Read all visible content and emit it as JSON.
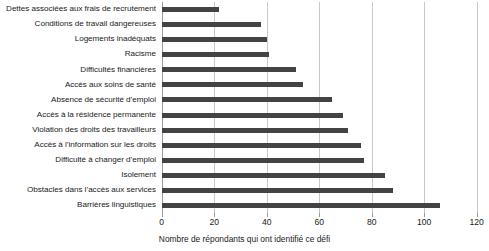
{
  "chart_data": {
    "type": "bar",
    "orientation": "horizontal",
    "title": "",
    "xlabel": "Nombre de répondants qui ont identifié ce défi",
    "ylabel": "",
    "xlim": [
      0,
      120
    ],
    "xticks": [
      0,
      20,
      40,
      60,
      80,
      100,
      120
    ],
    "grid": true,
    "legend": false,
    "bar_color": "#434343",
    "gridline_color": "#c8c8c8",
    "categories": [
      "Dettes associées aux frais de recrutement",
      "Conditions de travail dangereuses",
      "Logements inadéquats",
      "Racisme",
      "Difficultés financières",
      "Accès aux soins de santé",
      "Absence de sécurité d’emploi",
      "Accès à la résidence permanente",
      "Violation des droits des travailleurs",
      "Accès à l’information sur les droits",
      "Difficulté à changer d’emploi",
      "Isolement",
      "Obstacles dans l’accès aux services",
      "Barrières linguistiques"
    ],
    "values": [
      22,
      38,
      40,
      41,
      51,
      54,
      65,
      69,
      71,
      76,
      77,
      85,
      88,
      106
    ]
  }
}
